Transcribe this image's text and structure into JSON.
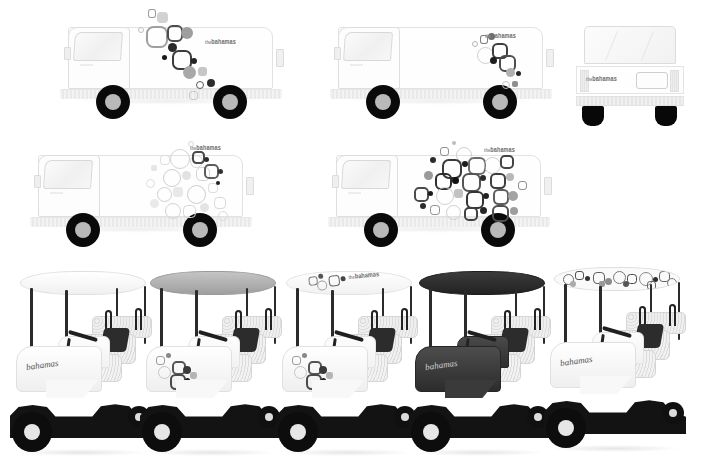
{
  "sheet": {
    "title": "Vehicle Livery Design Sheet",
    "background_color": "#ffffff",
    "description": "Bahamas tourism brand vehicle wrap mockups"
  },
  "brand": {
    "wordmark_prefix": "the",
    "wordmark_name": "bahamas",
    "script_logo": "bahamas",
    "colors": {
      "black": "#111111",
      "dark_gray": "#4a4a4a",
      "mid_gray": "#8c8c8c",
      "light_gray": "#c8c8c8",
      "pale_gray": "#e6e6e6",
      "white": "#ffffff"
    }
  },
  "row_trucks_top": {
    "label": "Delivery truck side views — row 1",
    "vehicles": [
      {
        "id": "truck-1",
        "type": "box-truck-side",
        "view": "side-profile-left",
        "body_color": "#fefefe",
        "graphic_style": "sparse-diagonal-bubble-cluster",
        "graphic_density": "low",
        "wordmark_visible": true
      },
      {
        "id": "truck-2",
        "type": "box-truck-side",
        "view": "side-profile-left",
        "body_color": "#fefefe",
        "graphic_style": "compact-rear-bubble-cluster",
        "graphic_density": "low",
        "wordmark_visible": true
      },
      {
        "id": "truck-3",
        "type": "box-truck-front",
        "view": "front-elevation",
        "body_color": "#fefefe",
        "graphic_style": "wordmark-only",
        "graphic_density": "none",
        "wordmark_visible": true
      }
    ]
  },
  "row_trucks_bottom": {
    "label": "Delivery truck side views — row 2",
    "vehicles": [
      {
        "id": "truck-4",
        "type": "box-truck-side",
        "view": "side-profile-left",
        "body_color": "#fefefe",
        "graphic_style": "dense-pale-bubble-field",
        "graphic_density": "high-light",
        "wordmark_visible": true
      },
      {
        "id": "truck-5",
        "type": "box-truck-side",
        "view": "side-profile-left",
        "body_color": "#fefefe",
        "graphic_style": "dense-high-contrast-bubble-field",
        "graphic_density": "high-dark",
        "wordmark_visible": true
      }
    ]
  },
  "row_carts": {
    "label": "Golf cart livery options",
    "vehicles": [
      {
        "id": "cart-1",
        "type": "golf-cart",
        "canopy_color": "#fafafa",
        "canopy_style": "plain-white",
        "body_color": "#fbfbfb",
        "body_style": "plain-white",
        "side_graphic": "script-logo",
        "option_number": "1"
      },
      {
        "id": "cart-2",
        "type": "golf-cart",
        "canopy_color": "#b4b4b4",
        "canopy_style": "solid-gray",
        "body_color": "#fbfbfb",
        "body_style": "bubble-graphic-panel",
        "side_graphic": "bubble-cluster",
        "option_number": "2"
      },
      {
        "id": "cart-3",
        "type": "golf-cart",
        "canopy_color": "#f5f5f5",
        "canopy_style": "white-with-wordmark",
        "body_color": "#fbfbfb",
        "body_style": "bubble-graphic-panel",
        "side_graphic": "bubble-cluster",
        "option_number": "3"
      },
      {
        "id": "cart-4",
        "type": "golf-cart",
        "canopy_color": "#2e2e2e",
        "canopy_style": "solid-dark",
        "body_color": "#3a3a3a",
        "body_style": "solid-dark",
        "side_graphic": "script-logo-light",
        "option_number": "4"
      },
      {
        "id": "cart-5",
        "type": "golf-cart",
        "canopy_color": "#f7f7f7",
        "canopy_style": "bubble-pattern-print",
        "body_color": "#fbfbfb",
        "body_style": "plain-white",
        "side_graphic": "script-logo",
        "option_number": "5"
      }
    ]
  }
}
